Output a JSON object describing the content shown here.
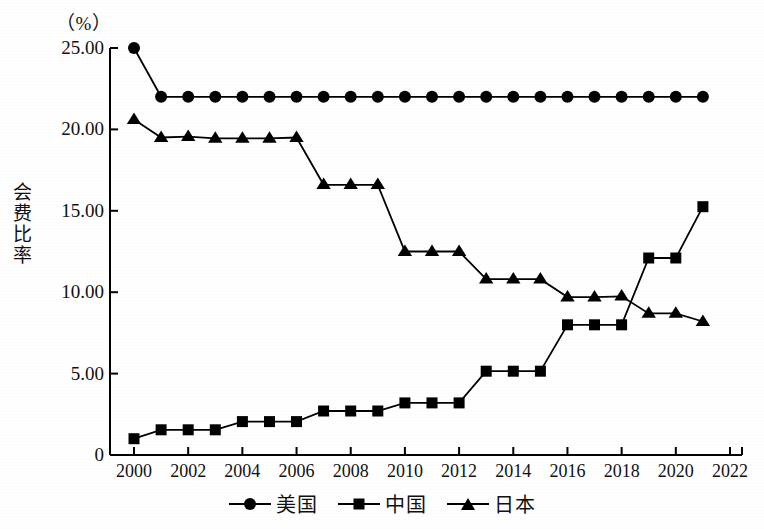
{
  "chart_data": {
    "type": "line",
    "title": "",
    "unit_label": "（%）",
    "ylabel": "会费比率",
    "xlabel": "",
    "ylim": [
      0,
      25
    ],
    "xlim": [
      2000,
      2022
    ],
    "grid": false,
    "legend_position": "bottom",
    "y_ticks": [
      {
        "value": 0,
        "label": "0"
      },
      {
        "value": 5,
        "label": "5.00"
      },
      {
        "value": 10,
        "label": "10.00"
      },
      {
        "value": 15,
        "label": "15.00"
      },
      {
        "value": 20,
        "label": "20.00"
      },
      {
        "value": 25,
        "label": "25.00"
      }
    ],
    "x_ticks": [
      {
        "value": 2000,
        "label": "2000"
      },
      {
        "value": 2002,
        "label": "2002"
      },
      {
        "value": 2004,
        "label": "2004"
      },
      {
        "value": 2006,
        "label": "2006"
      },
      {
        "value": 2008,
        "label": "2008"
      },
      {
        "value": 2010,
        "label": "2010"
      },
      {
        "value": 2012,
        "label": "2012"
      },
      {
        "value": 2014,
        "label": "2014"
      },
      {
        "value": 2016,
        "label": "2016"
      },
      {
        "value": 2018,
        "label": "2018"
      },
      {
        "value": 2020,
        "label": "2020"
      },
      {
        "value": 2022,
        "label": "2022"
      }
    ],
    "x": [
      2000,
      2001,
      2002,
      2003,
      2004,
      2005,
      2006,
      2007,
      2008,
      2009,
      2010,
      2011,
      2012,
      2013,
      2014,
      2015,
      2016,
      2017,
      2018,
      2019,
      2020,
      2021
    ],
    "series": [
      {
        "name": "美国",
        "marker": "circle",
        "color": "#000000",
        "values": [
          25.0,
          22.0,
          22.0,
          22.0,
          22.0,
          22.0,
          22.0,
          22.0,
          22.0,
          22.0,
          22.0,
          22.0,
          22.0,
          22.0,
          22.0,
          22.0,
          22.0,
          22.0,
          22.0,
          22.0,
          22.0,
          22.0
        ]
      },
      {
        "name": "中国",
        "marker": "square",
        "color": "#000000",
        "values": [
          1.0,
          1.55,
          1.55,
          1.55,
          2.05,
          2.05,
          2.05,
          2.7,
          2.7,
          2.7,
          3.2,
          3.2,
          3.2,
          5.15,
          5.15,
          5.15,
          8.0,
          8.0,
          8.0,
          12.1,
          12.1,
          15.25
        ]
      },
      {
        "name": "日本",
        "marker": "triangle",
        "color": "#000000",
        "values": [
          20.6,
          19.5,
          19.55,
          19.45,
          19.45,
          19.45,
          19.5,
          16.6,
          16.6,
          16.6,
          12.5,
          12.5,
          12.5,
          10.8,
          10.8,
          10.8,
          9.7,
          9.7,
          9.75,
          8.7,
          8.7,
          8.2
        ]
      }
    ]
  },
  "legend": {
    "items": [
      {
        "label": "美国",
        "marker": "circle"
      },
      {
        "label": "中国",
        "marker": "square"
      },
      {
        "label": "日本",
        "marker": "triangle"
      }
    ]
  }
}
